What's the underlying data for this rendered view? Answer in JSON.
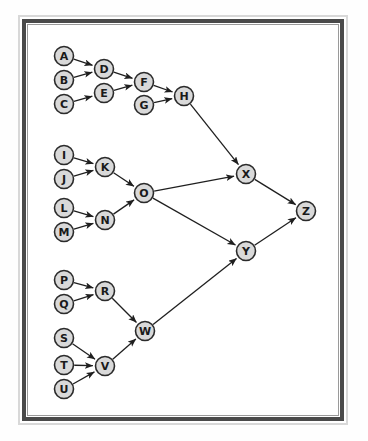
{
  "figure": {
    "background_color": "#ffffff",
    "frame": {
      "outer_border_color": "#d8d8d8",
      "inner_border_color": "#4a4a4a",
      "hairline_color": "#9a9a9a"
    },
    "style": {
      "node_fill": "#d9d9d9",
      "node_stroke": "#2b2b2b",
      "edge_color": "#1f1f1f",
      "label_color": "#1a1a1a",
      "node_radius": 9.5
    }
  },
  "chart_data": {
    "type": "diagram",
    "diagram_kind": "directed-graph",
    "title": "",
    "node_count": 26,
    "edge_count": 26,
    "nodes": [
      {
        "id": "A",
        "label": "A",
        "x": 37,
        "y": 32,
        "cluster": "top"
      },
      {
        "id": "B",
        "label": "B",
        "x": 37,
        "y": 56,
        "cluster": "top"
      },
      {
        "id": "C",
        "label": "C",
        "x": 37,
        "y": 80,
        "cluster": "top"
      },
      {
        "id": "D",
        "label": "D",
        "x": 77,
        "y": 45,
        "cluster": "top"
      },
      {
        "id": "E",
        "label": "E",
        "x": 77,
        "y": 69,
        "cluster": "top"
      },
      {
        "id": "F",
        "label": "F",
        "x": 117,
        "y": 58,
        "cluster": "top"
      },
      {
        "id": "G",
        "label": "G",
        "x": 117,
        "y": 81,
        "cluster": "top"
      },
      {
        "id": "H",
        "label": "H",
        "x": 157,
        "y": 72,
        "cluster": "top"
      },
      {
        "id": "I",
        "label": "I",
        "x": 37,
        "y": 131,
        "cluster": "middle"
      },
      {
        "id": "J",
        "label": "J",
        "x": 37,
        "y": 155,
        "cluster": "middle"
      },
      {
        "id": "K",
        "label": "K",
        "x": 78,
        "y": 143,
        "cluster": "middle"
      },
      {
        "id": "L",
        "label": "L",
        "x": 37,
        "y": 184,
        "cluster": "middle"
      },
      {
        "id": "M",
        "label": "M",
        "x": 37,
        "y": 208,
        "cluster": "middle"
      },
      {
        "id": "N",
        "label": "N",
        "x": 78,
        "y": 196,
        "cluster": "middle"
      },
      {
        "id": "O",
        "label": "O",
        "x": 117,
        "y": 169,
        "cluster": "middle"
      },
      {
        "id": "P",
        "label": "P",
        "x": 37,
        "y": 256,
        "cluster": "bottom"
      },
      {
        "id": "Q",
        "label": "Q",
        "x": 37,
        "y": 280,
        "cluster": "bottom"
      },
      {
        "id": "R",
        "label": "R",
        "x": 78,
        "y": 267,
        "cluster": "bottom"
      },
      {
        "id": "S",
        "label": "S",
        "x": 37,
        "y": 314,
        "cluster": "bottom"
      },
      {
        "id": "T",
        "label": "T",
        "x": 37,
        "y": 341,
        "cluster": "bottom"
      },
      {
        "id": "U",
        "label": "U",
        "x": 37,
        "y": 365,
        "cluster": "bottom"
      },
      {
        "id": "V",
        "label": "V",
        "x": 78,
        "y": 342,
        "cluster": "bottom"
      },
      {
        "id": "W",
        "label": "W",
        "x": 118,
        "y": 307,
        "cluster": "bottom"
      },
      {
        "id": "X",
        "label": "X",
        "x": 219,
        "y": 150,
        "cluster": "merge"
      },
      {
        "id": "Y",
        "label": "Y",
        "x": 219,
        "y": 227,
        "cluster": "merge"
      },
      {
        "id": "Z",
        "label": "Z",
        "x": 279,
        "y": 187,
        "cluster": "sink"
      }
    ],
    "edges": [
      {
        "from": "A",
        "to": "D"
      },
      {
        "from": "B",
        "to": "D"
      },
      {
        "from": "C",
        "to": "E"
      },
      {
        "from": "D",
        "to": "F"
      },
      {
        "from": "E",
        "to": "F"
      },
      {
        "from": "F",
        "to": "H"
      },
      {
        "from": "G",
        "to": "H"
      },
      {
        "from": "H",
        "to": "X"
      },
      {
        "from": "I",
        "to": "K"
      },
      {
        "from": "J",
        "to": "K"
      },
      {
        "from": "K",
        "to": "O"
      },
      {
        "from": "L",
        "to": "N"
      },
      {
        "from": "M",
        "to": "N"
      },
      {
        "from": "N",
        "to": "O"
      },
      {
        "from": "O",
        "to": "X"
      },
      {
        "from": "O",
        "to": "Y"
      },
      {
        "from": "P",
        "to": "R"
      },
      {
        "from": "Q",
        "to": "R"
      },
      {
        "from": "R",
        "to": "W"
      },
      {
        "from": "S",
        "to": "V"
      },
      {
        "from": "T",
        "to": "V"
      },
      {
        "from": "U",
        "to": "V"
      },
      {
        "from": "V",
        "to": "W"
      },
      {
        "from": "W",
        "to": "Y"
      },
      {
        "from": "X",
        "to": "Z"
      },
      {
        "from": "Y",
        "to": "Z"
      }
    ]
  }
}
